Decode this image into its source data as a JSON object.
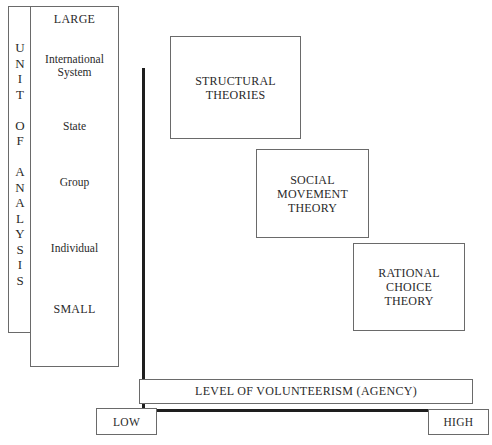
{
  "y_axis": {
    "title_letters": [
      "U",
      "N",
      "I",
      "T",
      "",
      "O",
      "F",
      "",
      "A",
      "N",
      "A",
      "L",
      "Y",
      "S",
      "I",
      "S"
    ],
    "title": "UNIT OF ANALYSIS",
    "top_label": "LARGE",
    "bottom_label": "SMALL",
    "levels": [
      {
        "line1": "International",
        "line2": "System"
      },
      {
        "line1": "State",
        "line2": ""
      },
      {
        "line1": "Group",
        "line2": ""
      },
      {
        "line1": "Individual",
        "line2": ""
      }
    ]
  },
  "x_axis": {
    "title": "LEVEL OF VOLUNTEERISM (AGENCY)",
    "low_label": "LOW",
    "high_label": "HIGH"
  },
  "theories": [
    {
      "line1": "STRUCTURAL",
      "line2": "THEORIES",
      "line3": ""
    },
    {
      "line1": "SOCIAL",
      "line2": "MOVEMENT",
      "line3": "THEORY"
    },
    {
      "line1": "RATIONAL",
      "line2": "CHOICE",
      "line3": "THEORY"
    }
  ],
  "colors": {
    "line": "#1e1e1e",
    "border": "#6a6a6a",
    "text": "#2a2a2a",
    "background": "#ffffff"
  }
}
